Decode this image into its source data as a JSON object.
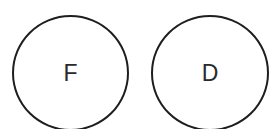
{
  "diagram": {
    "nodes": [
      {
        "label": "F",
        "shape": "circle"
      },
      {
        "label": "D",
        "shape": "circle"
      }
    ],
    "colors": {
      "stroke": "#1e1e1e",
      "text": "#2a2a2a",
      "background": "#ffffff"
    }
  }
}
